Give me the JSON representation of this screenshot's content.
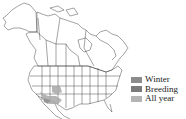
{
  "map": {
    "region": "North America",
    "range_color": "#a8a8a8"
  },
  "legend": {
    "items": [
      {
        "label": "Winter",
        "color": "#8c8c8c"
      },
      {
        "label": "Breeding",
        "color": "#7a7a7a"
      },
      {
        "label": "All year",
        "color": "#b4b4b4"
      }
    ]
  }
}
